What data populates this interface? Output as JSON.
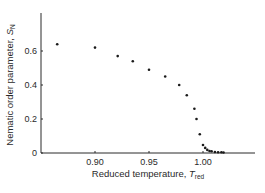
{
  "chart_data": {
    "type": "scatter",
    "title": "",
    "xlabel": "Reduced temperature, T_red",
    "ylabel": "Nematic order parameter, S_N",
    "xlabel_parts": {
      "main": "Reduced temperature, ",
      "symbol": "T",
      "subscript": "red"
    },
    "ylabel_parts": {
      "main": "Nematic order parameter, ",
      "symbol": "S",
      "subscript": "N"
    },
    "xlim": [
      0.855,
      1.048
    ],
    "ylim": [
      0,
      0.82
    ],
    "x_ticks": [
      0.9,
      0.95,
      1.0
    ],
    "x_tick_labels": [
      "0.90",
      "0.95",
      "1.00"
    ],
    "y_ticks": [
      0,
      0.2,
      0.4,
      0.6
    ],
    "y_tick_labels": [
      "0",
      "0.2",
      "0.4",
      "0.6"
    ],
    "grid": false,
    "legend": null,
    "series": [
      {
        "name": "S_N",
        "marker": "dot",
        "color": "#1a1a1a",
        "x": [
          0.865,
          0.9,
          0.921,
          0.935,
          0.95,
          0.965,
          0.978,
          0.985,
          0.992,
          0.994,
          0.997,
          1.0,
          1.002,
          1.004,
          1.006,
          1.008,
          1.011,
          1.014,
          1.017,
          1.019
        ],
        "y": [
          0.64,
          0.62,
          0.57,
          0.54,
          0.49,
          0.45,
          0.4,
          0.34,
          0.26,
          0.2,
          0.11,
          0.047,
          0.03,
          0.018,
          0.012,
          0.01,
          0.006,
          0.005,
          0.004,
          0.003
        ]
      }
    ]
  },
  "layout": {
    "plot_left": 41,
    "plot_bottom": 153,
    "plot_top": 13,
    "plot_right": 255,
    "x_px_ref": [
      95,
      203
    ],
    "x_val_ref": [
      0.9,
      1.0
    ],
    "y_px_ref": [
      153,
      119
    ],
    "y_val_ref": [
      0,
      0.2
    ]
  },
  "colors": {
    "axis": "#2a2a2a",
    "point": "#1a1a1a",
    "background": "#ffffff"
  }
}
